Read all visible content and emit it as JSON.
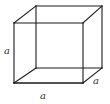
{
  "diagram": {
    "type": "cube",
    "labels": {
      "left_edge": "a",
      "bottom_edge": "a",
      "depth_edge": "a"
    },
    "colors": {
      "stroke": "#1a1a1a",
      "label": "#333333",
      "background": "#ffffff"
    }
  }
}
